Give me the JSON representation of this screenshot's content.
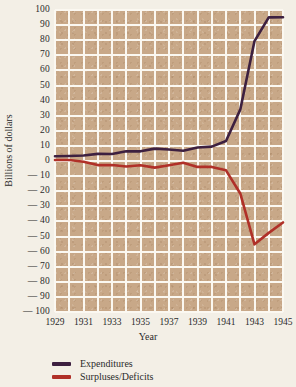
{
  "chart_data": {
    "type": "line",
    "title": "",
    "xlabel": "Year",
    "ylabel": "Billions of dollars",
    "xlim": [
      1929,
      1945
    ],
    "ylim": [
      -100,
      100
    ],
    "grid": true,
    "legend_position": "below-left",
    "x": [
      1929,
      1930,
      1931,
      1932,
      1933,
      1934,
      1935,
      1936,
      1937,
      1938,
      1939,
      1940,
      1941,
      1942,
      1943,
      1944,
      1945
    ],
    "xtick_labels": [
      "1929",
      "1931",
      "1933",
      "1935",
      "1937",
      "1939",
      "1941",
      "1943",
      "1945"
    ],
    "xticks": [
      1929,
      1931,
      1933,
      1935,
      1937,
      1939,
      1941,
      1943,
      1945
    ],
    "ytick_labels": [
      "100",
      "90",
      "80",
      "70",
      "60",
      "50",
      "40",
      "30",
      "20",
      "10",
      "0",
      "— 10",
      "— 20",
      "— 30",
      "— 40",
      "— 50",
      "— 60",
      "— 70",
      "— 80",
      "— 90",
      "— 100"
    ],
    "yticks": [
      100,
      90,
      80,
      70,
      60,
      50,
      40,
      30,
      20,
      10,
      0,
      -10,
      -20,
      -30,
      -40,
      -50,
      -60,
      -70,
      -80,
      -90,
      -100
    ],
    "series": [
      {
        "name": "Expenditures",
        "color": "#3d2040",
        "values": [
          3.1,
          3.3,
          3.6,
          4.7,
          4.6,
          6.5,
          6.4,
          8.2,
          7.6,
          6.8,
          8.9,
          9.5,
          13.3,
          34.0,
          79.4,
          95.1,
          95.2
        ]
      },
      {
        "name": "Surpluses/Deficits",
        "color": "#b03028",
        "values": [
          0.7,
          0.7,
          -0.5,
          -2.7,
          -2.6,
          -3.6,
          -2.8,
          -4.4,
          -2.8,
          -1.2,
          -3.9,
          -3.9,
          -6.2,
          -21.5,
          -55.2,
          -47.6,
          -40.7
        ]
      }
    ]
  },
  "legend": {
    "items": [
      {
        "label": "Expenditures",
        "color": "#3d2040"
      },
      {
        "label": "Surpluses/Deficits",
        "color": "#b03028"
      }
    ]
  }
}
